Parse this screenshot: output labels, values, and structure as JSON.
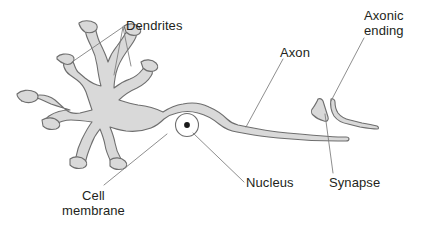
{
  "figure": {
    "background_color": "#ffffff",
    "cell_fill_color": "#d9d9d9",
    "cell_outline_color": "#6e6e6e",
    "leader_line_color": "#7a7a7a",
    "text_color": "#231f20",
    "nucleus_fill_color": "#ffffff",
    "nucleolus_color": "#1a1a1a"
  },
  "labels": {
    "dendrites": "Dendrites",
    "axon": "Axon",
    "axonic_ending_line1": "Axonic",
    "axonic_ending_line2": "ending",
    "nucleus": "Nucleus",
    "synapse": "Synapse",
    "cell_membrane_line1": "Cell",
    "cell_membrane_line2": "membrane"
  },
  "parts": [
    {
      "name": "dendrites",
      "label": "Dendrites"
    },
    {
      "name": "cell-membrane",
      "label": "Cell membrane"
    },
    {
      "name": "nucleus",
      "label": "Nucleus"
    },
    {
      "name": "axon",
      "label": "Axon"
    },
    {
      "name": "axonic-ending",
      "label": "Axonic ending"
    },
    {
      "name": "synapse",
      "label": "Synapse"
    }
  ]
}
